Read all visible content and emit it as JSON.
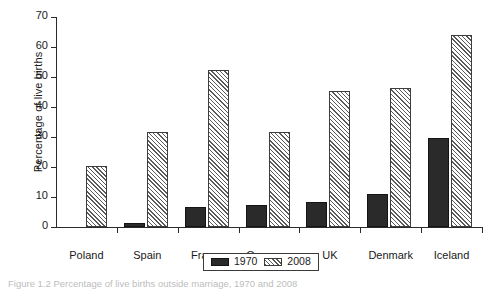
{
  "figure": {
    "caption": "Figure 1.2   Percentage of live births outside marriage, 1970 and 2008"
  },
  "legend": {
    "position": "bottom-center",
    "entries": [
      {
        "label": "1970",
        "swatch": "solid-black-swatch"
      },
      {
        "label": "2008",
        "swatch": "diagonal-hatch-swatch"
      }
    ]
  },
  "chart_data": {
    "type": "bar",
    "title": "",
    "xlabel": "",
    "ylabel": "Percentage of live births",
    "ylim": [
      0,
      70
    ],
    "yticks": [
      0,
      10,
      20,
      30,
      40,
      50,
      60,
      70
    ],
    "grid": false,
    "categories": [
      "Poland",
      "Spain",
      "France",
      "Germany",
      "UK",
      "Denmark",
      "Iceland"
    ],
    "series": [
      {
        "name": "1970",
        "values": [
          0,
          1.4,
          6.8,
          7.5,
          8.3,
          11,
          29.8
        ]
      },
      {
        "name": "2008",
        "values": [
          20.2,
          31.7,
          52.4,
          31.6,
          45.4,
          46.2,
          64.1
        ]
      }
    ]
  }
}
